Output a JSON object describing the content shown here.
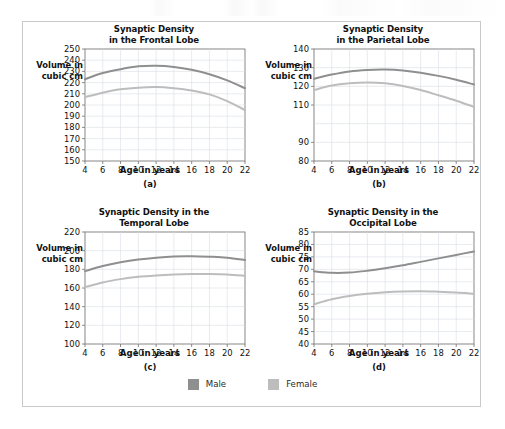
{
  "figure": {
    "legend": {
      "position": "bottom-center",
      "entries": [
        {
          "label": "Male",
          "color": "#8f8f8f"
        },
        {
          "label": "Female",
          "color": "#bdbdbd"
        }
      ]
    }
  },
  "chart_data": [
    {
      "type": "line",
      "panel": "(a)",
      "title": "Synaptic Density\nin the Frontal Lobe",
      "title_line1": "Synaptic Density",
      "title_line2": "in the Frontal Lobe",
      "xlabel": "Age in years",
      "ylabel": "Volume in\ncubic cm",
      "ylabel_line1": "Volume in",
      "ylabel_line2": "cubic cm",
      "grid": true,
      "xlim": [
        4,
        22
      ],
      "ylim": [
        150,
        250
      ],
      "xticks": [
        4,
        6,
        8,
        10,
        12,
        14,
        16,
        18,
        20,
        22
      ],
      "yticks": [
        150,
        160,
        170,
        180,
        190,
        200,
        210,
        220,
        230,
        240,
        250
      ],
      "x": [
        4,
        6,
        8,
        10,
        12,
        14,
        16,
        18,
        20,
        22
      ],
      "series": [
        {
          "name": "Male",
          "color": "#8f8f8f",
          "values": [
            223,
            228.5,
            232,
            234.5,
            235,
            234,
            231.5,
            227.5,
            222,
            215
          ]
        },
        {
          "name": "Female",
          "color": "#bdbdbd",
          "values": [
            207,
            211,
            214,
            215.5,
            216,
            215,
            213,
            209.5,
            203.5,
            195.5
          ]
        }
      ]
    },
    {
      "type": "line",
      "panel": "(b)",
      "title": "Synaptic Density\nin the Parietal Lobe",
      "title_line1": "Synaptic Density",
      "title_line2": "in the Parietal Lobe",
      "xlabel": "Age in years",
      "ylabel": "Volume in\ncubic cm",
      "ylabel_line1": "Volume in",
      "ylabel_line2": "cubic cm",
      "grid": true,
      "xlim": [
        4,
        22
      ],
      "ylim": [
        80,
        140
      ],
      "xticks": [
        4,
        6,
        8,
        10,
        12,
        14,
        16,
        18,
        20,
        22
      ],
      "yticks": [
        80,
        90,
        110,
        120,
        130,
        140
      ],
      "ytick_values": [
        80,
        90,
        100,
        110,
        120,
        130,
        140
      ],
      "ytick_note": "label for 100 is not printed in the source figure",
      "x": [
        4,
        6,
        8,
        10,
        12,
        14,
        16,
        18,
        20,
        22
      ],
      "series": [
        {
          "name": "Male",
          "color": "#8f8f8f",
          "values": [
            124,
            126.3,
            128,
            128.8,
            129,
            128.5,
            127.3,
            125.6,
            123.5,
            121
          ]
        },
        {
          "name": "Female",
          "color": "#bdbdbd",
          "values": [
            118,
            120.4,
            121.6,
            122,
            121.6,
            120.2,
            118,
            115.2,
            112.3,
            109
          ]
        }
      ]
    },
    {
      "type": "line",
      "panel": "(c)",
      "title": "Synaptic Density in the\nTemporal Lobe",
      "title_line1": "Synaptic Density in the",
      "title_line2": "Temporal Lobe",
      "xlabel": "Age in years",
      "ylabel": "Volume in\ncubic cm",
      "ylabel_line1": "Volume in",
      "ylabel_line2": "cubic cm",
      "grid": true,
      "xlim": [
        4,
        22
      ],
      "ylim": [
        100,
        220
      ],
      "xticks": [
        4,
        6,
        8,
        10,
        12,
        14,
        16,
        18,
        20,
        22
      ],
      "yticks": [
        100,
        120,
        140,
        160,
        180,
        200,
        220
      ],
      "x": [
        4,
        6,
        8,
        10,
        12,
        14,
        16,
        18,
        20,
        22
      ],
      "series": [
        {
          "name": "Male",
          "color": "#8f8f8f",
          "values": [
            178,
            183.5,
            187.5,
            190.5,
            192.5,
            193.8,
            194,
            193.5,
            192.5,
            190
          ]
        },
        {
          "name": "Female",
          "color": "#bdbdbd",
          "values": [
            161,
            166,
            169.5,
            172,
            173.5,
            174.5,
            175,
            175,
            174.5,
            173
          ]
        }
      ]
    },
    {
      "type": "line",
      "panel": "(d)",
      "title": "Synaptic Density in the\nOccipital Lobe",
      "title_line1": "Synaptic Density in the",
      "title_line2": "Occipital Lobe",
      "xlabel": "Age in years",
      "ylabel": "Volume in\ncubic cm",
      "ylabel_line1": "Volume in",
      "ylabel_line2": "cubic cm",
      "grid": true,
      "xlim": [
        4,
        22
      ],
      "ylim": [
        40,
        85
      ],
      "xticks": [
        4,
        6,
        8,
        10,
        12,
        14,
        16,
        18,
        20,
        22
      ],
      "yticks": [
        40,
        45,
        50,
        55,
        60,
        65,
        70,
        75,
        80,
        85
      ],
      "x": [
        4,
        6,
        8,
        10,
        12,
        14,
        16,
        18,
        20,
        22
      ],
      "series": [
        {
          "name": "Male",
          "color": "#8f8f8f",
          "values": [
            69.2,
            68.6,
            68.7,
            69.4,
            70.4,
            71.6,
            73.0,
            74.4,
            75.8,
            77.2
          ]
        },
        {
          "name": "Female",
          "color": "#bdbdbd",
          "values": [
            56.0,
            58.0,
            59.3,
            60.2,
            60.8,
            61.1,
            61.2,
            61.0,
            60.7,
            60.2
          ]
        }
      ]
    }
  ]
}
